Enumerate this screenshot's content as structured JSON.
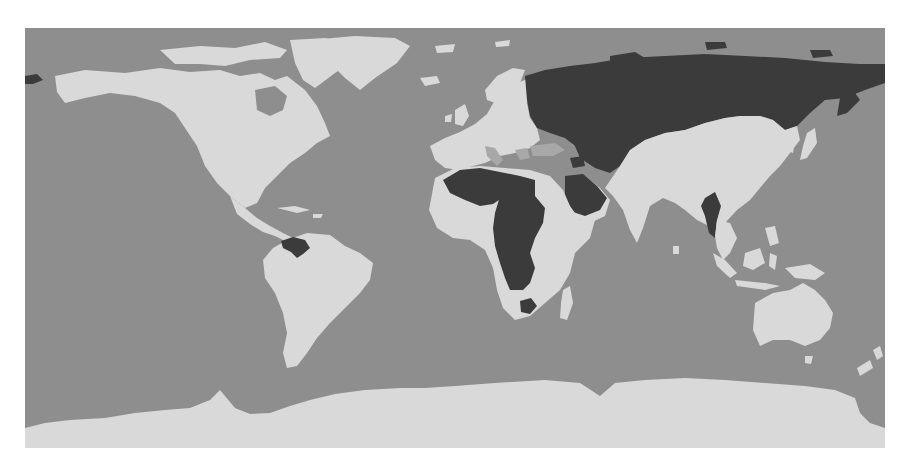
{
  "map": {
    "projection": "equirectangular",
    "colors": {
      "background": "#ffffff",
      "ocean": "#8e8e8e",
      "land_default": "#d9d9d9",
      "land_mid": "#a8a8a8",
      "land_highlight": "#3b3b3b"
    },
    "highlighted_regions": [
      "Russia",
      "Venezuela",
      "Algeria",
      "Libya",
      "Chad",
      "Central African Republic",
      "Democratic Republic of the Congo",
      "Congo",
      "Cameroon",
      "Saudi Arabia",
      "Syria",
      "Myanmar",
      "Zimbabwe",
      "Eastern Alaska / Chukotka"
    ],
    "mid_shaded_regions": [
      "Turkey",
      "Caspian region",
      "Italy",
      "Greece",
      "Yemen"
    ],
    "legend": null,
    "title": null
  }
}
